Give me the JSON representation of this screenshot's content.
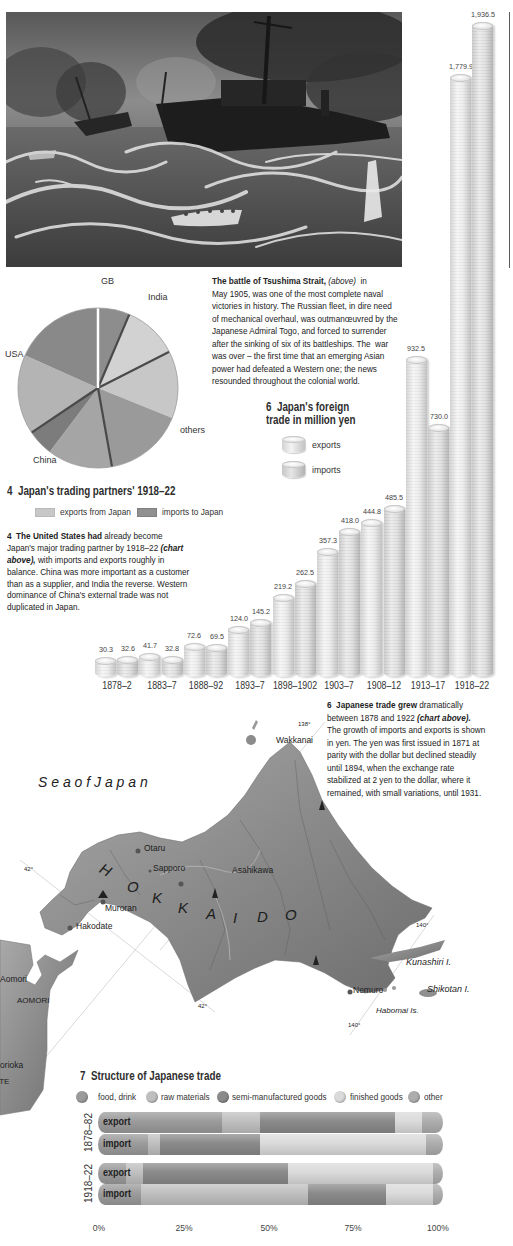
{
  "pie_labels": {
    "gb": "GB",
    "india": "India",
    "usa": "USA",
    "others": "others",
    "china": "China"
  },
  "section4": {
    "title": "4  Japan's trading partners' 1918–22",
    "legend": {
      "exports": "exports from Japan",
      "imports": "imports to Japan"
    },
    "paragraph": [
      [
        "4  The United States had",
        " already become"
      ],
      [
        "Japan's major trading partner by 1918–22 ",
        "(chart"
      ],
      [
        "above),",
        " with imports and exports roughly in"
      ],
      [
        "balance. China was more important as a customer"
      ],
      [
        "than as a supplier, and India the reverse. Western"
      ],
      [
        "dominance of China's external trade was not"
      ],
      [
        "duplicated in Japan."
      ]
    ]
  },
  "tsushima": {
    "paragraph": [
      [
        "The battle of Tsushima Strait,",
        " (above)",
        "  in"
      ],
      [
        "May 1905, was one of the most complete naval"
      ],
      [
        "victories in history. The Russian fleet, in dire need"
      ],
      [
        "of mechanical overhaul, was outmanœuvred by the"
      ],
      [
        "Japanese Admiral Togo, and forced to surrender"
      ],
      [
        "after the sinking of six of its battleships. The  war"
      ],
      [
        "was over – the first time that an emerging Asian"
      ],
      [
        "power had defeated a Western one; the news"
      ],
      [
        "resounded throughout the colonial world."
      ]
    ]
  },
  "section6": {
    "title_line1": "6  Japan's foreign",
    "title_line2": "trade in million yen",
    "legend": {
      "exports": "exports",
      "imports": "imports"
    },
    "paragraph": [
      [
        "6  Japanese trade grew",
        " dramatically"
      ],
      [
        "between 1878 and 1922 ",
        "(chart above)."
      ],
      [
        "The growth of imports and exports is shown"
      ],
      [
        "in yen. The yen was first issued in 1871 at"
      ],
      [
        "parity with the dollar but declined steadily"
      ],
      [
        "until 1894, when the exchange rate"
      ],
      [
        "stabilized at 2 yen to the dollar, where it"
      ],
      [
        "remained, with small variations, until 1931."
      ]
    ]
  },
  "map": {
    "sea": "S e a   o f   J a p a n",
    "region_letters": [
      "H",
      "O",
      "K",
      "K",
      "A",
      "I",
      "D",
      "O"
    ],
    "cities": {
      "wakkanai": "Wakkanai",
      "otaru": "Otaru",
      "sapporo": "Sapporo",
      "asahikawa": "Asahikawa",
      "muroran": "Muroran",
      "hakodate": "Hakodate",
      "nemuro": "Nemuro",
      "aomori": "Aomori",
      "morioka": "Morioka"
    },
    "prefectures": {
      "aomori": "AOMORI",
      "iwate": "IWATE"
    },
    "islands": {
      "kunashiri": "Kunashiri I.",
      "shikotan": "Shikotan I.",
      "habomai": "Habomai Is."
    },
    "grid": {
      "lon138": "138°",
      "lon140a": "140°",
      "lon140b": "140°",
      "lat42a": "42°",
      "lat42b": "42°"
    }
  },
  "section7": {
    "title": "7  Structure of Japanese trade",
    "periods": [
      "1878–82",
      "1918–22"
    ],
    "rows": [
      "export",
      "import",
      "export",
      "import"
    ]
  },
  "chart_data": [
    {
      "id": "trading-partners",
      "type": "pie",
      "title": "4 Japan's trading partners' 1918–22",
      "unit": "share of total trade, % (estimated from slice angles)",
      "legend": [
        {
          "label": "exports from Japan",
          "color": "#c4c4c4"
        },
        {
          "label": "imports to Japan",
          "color": "#8f8f8f"
        }
      ],
      "legend_position": "below",
      "slices": [
        {
          "partner": "GB",
          "flow": "imports to Japan",
          "value": 6.4,
          "fill": "#8d8d8d"
        },
        {
          "partner": "India",
          "flow": "exports from Japan",
          "value": 11.1,
          "fill": "#d2d2d2"
        },
        {
          "partner": "others",
          "flow": "exports from Japan",
          "value": 13.6,
          "fill": "#c7c7c7"
        },
        {
          "partner": "others",
          "flow": "imports to Japan",
          "value": 16.1,
          "fill": "#9a9a9a"
        },
        {
          "partner": "China",
          "flow": "exports from Japan",
          "value": 13.1,
          "fill": "#a5a5a5"
        },
        {
          "partner": "China",
          "flow": "imports to Japan",
          "value": 5.3,
          "fill": "#7c7c7c"
        },
        {
          "partner": "USA",
          "flow": "exports from Japan",
          "value": 16.1,
          "fill": "#b4b4b4"
        },
        {
          "partner": "USA",
          "flow": "imports to Japan",
          "value": 18.3,
          "fill": "#898989"
        }
      ]
    },
    {
      "id": "foreign-trade",
      "type": "bar",
      "title": "6 Japan's foreign trade in million yen",
      "xlabel": "",
      "ylabel": "million yen",
      "ylim": [
        0,
        2000
      ],
      "grid": false,
      "legend_position": "upper-left",
      "categories": [
        "1878–2",
        "1883–7",
        "1888–92",
        "1893–7",
        "1898–1902",
        "1903–7",
        "1908–12",
        "1913–17",
        "1918–22"
      ],
      "series": [
        {
          "name": "exports",
          "values": [
            30.3,
            41.7,
            72.6,
            124.0,
            219.2,
            357.3,
            444.8,
            932.5,
            1779.9
          ],
          "labels": [
            "30.3",
            "41.7",
            "72.6",
            "124.0",
            "219.2",
            "357.3",
            "444.8",
            "932.5",
            "1,779.9"
          ]
        },
        {
          "name": "imports",
          "values": [
            32.6,
            32.8,
            69.5,
            145.2,
            262.5,
            418.0,
            485.5,
            730.0,
            1936.5
          ],
          "labels": [
            "32.6",
            "32.8",
            "69.5",
            "145.2",
            "262.5",
            "418.0",
            "485.5",
            "730.0",
            "1,936.5"
          ]
        }
      ]
    },
    {
      "id": "structure-of-trade",
      "type": "bar",
      "orientation": "horizontal",
      "stacked": true,
      "title": "7 Structure of Japanese trade",
      "categories": [
        "1878–82 export",
        "1878–82 import",
        "1918–22 export",
        "1918–22 import"
      ],
      "xlim": [
        0,
        100
      ],
      "xticks": [
        "0%",
        "25%",
        "50%",
        "75%",
        "100%"
      ],
      "legend_position": "top",
      "series": [
        {
          "name": "food, drink",
          "color": "#9b9b9b",
          "values": [
            36,
            14.5,
            8,
            12.5
          ]
        },
        {
          "name": "raw materials",
          "color": "#bfbfbf",
          "values": [
            11,
            3.5,
            5,
            48.5
          ]
        },
        {
          "name": "semi-manufactured goods",
          "color": "#8a8a8a",
          "values": [
            39,
            29,
            42,
            22.5
          ]
        },
        {
          "name": "finished goods",
          "color": "#dadada",
          "values": [
            8,
            48,
            42,
            13.5
          ]
        },
        {
          "name": "other",
          "color": "#adadad",
          "values": [
            6,
            5,
            3,
            3
          ]
        }
      ]
    }
  ]
}
